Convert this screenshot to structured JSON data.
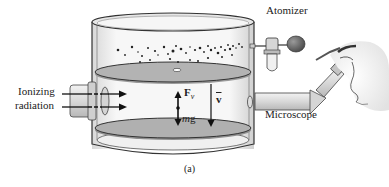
{
  "figure": {
    "caption": "(a)",
    "labels": {
      "ionizing": "Ionizing",
      "radiation": "radiation",
      "atomizer": "Atomizer",
      "microscope": "Microscope",
      "force_symbol": "F",
      "force_subscript": "v",
      "weight_m": "m",
      "weight_g": "g",
      "velocity": "v"
    },
    "colors": {
      "outline": "#333333",
      "plate_fill": "#a8a8a8",
      "glass_fill": "#f4f4f4",
      "droplet": "#222222",
      "arrow": "#111111"
    }
  }
}
